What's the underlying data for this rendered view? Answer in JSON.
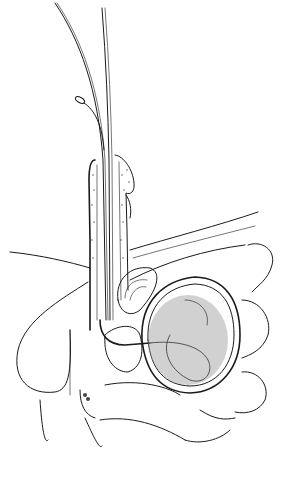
{
  "figure": {
    "type": "anatomical-line-illustration",
    "colors": {
      "ink": "#1a1a1a",
      "background": "#ffffff"
    },
    "elements": [
      "guidewire-left",
      "guidewire-right",
      "catheter-with-tip",
      "penis-cross-section",
      "urethra",
      "scrotum",
      "testis",
      "pubic-symphysis",
      "prostate",
      "bladder",
      "coiled-catheter-in-bladder",
      "abdominal-wall",
      "bowel-loops",
      "rectum"
    ]
  }
}
